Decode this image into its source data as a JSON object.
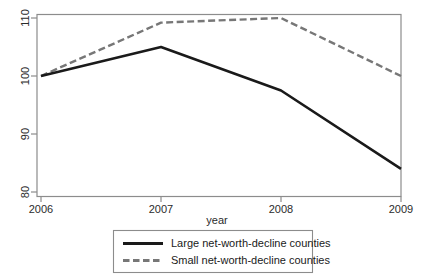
{
  "chart_data": {
    "type": "line",
    "title": "",
    "xlabel": "year",
    "ylabel": "",
    "x": [
      2006,
      2007,
      2008,
      2009
    ],
    "categories": [
      "2006",
      "2007",
      "2008",
      "2009"
    ],
    "xlim": [
      2006,
      2009
    ],
    "ylim": [
      80,
      110
    ],
    "xticks": [
      "2006",
      "2007",
      "2008",
      "2009"
    ],
    "yticks": [
      "80",
      "90",
      "100",
      "110"
    ],
    "grid": false,
    "legend_position": "below-axis",
    "series": [
      {
        "name": "Large net-worth-decline counties",
        "values": [
          100,
          105,
          97.5,
          84
        ],
        "color": "#1a1a1a",
        "style": "solid"
      },
      {
        "name": "Small net-worth-decline counties",
        "values": [
          100,
          109.2,
          110,
          100
        ],
        "color": "#777777",
        "style": "dashed"
      }
    ]
  },
  "axes": {
    "y_tick_labels": [
      "110",
      "100",
      "90",
      "80"
    ],
    "x_tick_labels": [
      "2006",
      "2007",
      "2008",
      "2009"
    ],
    "x_axis_title": "year"
  },
  "legend": {
    "entries": [
      {
        "label": "Large net-worth-decline counties",
        "swatch": "solid-line-swatch"
      },
      {
        "label": "Small net-worth-decline counties",
        "swatch": "dashed-line-swatch"
      }
    ]
  },
  "colors": {
    "series_large": "#1a1a1a",
    "series_small": "#777777",
    "frame": "#8c8c8c",
    "legend_border": "#8c8c8c",
    "background": "#ffffff"
  }
}
